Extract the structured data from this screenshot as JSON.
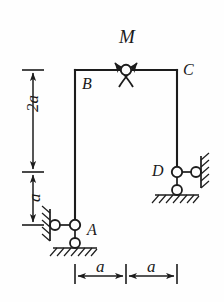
{
  "figure": {
    "type": "structural-frame-diagram",
    "stroke_color": "#1c1c1c",
    "background_color": "#fefefe"
  },
  "labels": {
    "moment": "M",
    "joint_b": "B",
    "joint_c": "C",
    "joint_d": "D",
    "joint_a": "A",
    "dim_vertical_upper": "2a",
    "dim_vertical_lower": "a",
    "dim_horizontal_left": "a",
    "dim_horizontal_right": "a"
  },
  "geometry": {
    "beam_y": 70,
    "beam_x_start": 75,
    "beam_x_end": 177,
    "hinge_x": 126,
    "left_column_bottom_y": 225,
    "right_column_bottom_y": 172,
    "span_left": "a",
    "span_right": "a",
    "height_upper": "2a",
    "height_lower": "a"
  },
  "elements": {
    "top_beam": "beam-BC",
    "left_column": "column-BA",
    "right_column": "column-CD",
    "hinge": "internal-hinge",
    "support_a": "pin-link-support-A",
    "support_d": "pin-link-support-D",
    "moment_arrows": "double-curved-arrow-moment"
  }
}
